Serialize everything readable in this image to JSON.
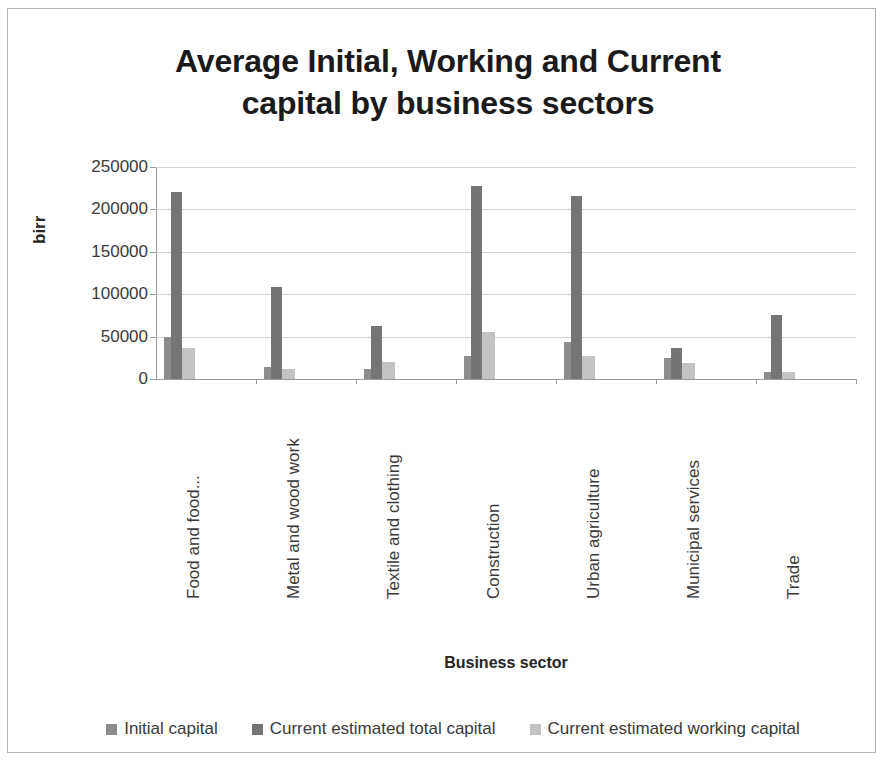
{
  "chart_data": {
    "type": "bar",
    "title": "Average Initial, Working and Current capital by business sectors",
    "title_line1": "Average Initial, Working and Current",
    "title_line2": "capital by business sectors",
    "xlabel": "Business sector",
    "ylabel": "birr",
    "ylim": [
      0,
      250000
    ],
    "ytick_labels": [
      "250000",
      "200000",
      "150000",
      "100000",
      "50000",
      "0"
    ],
    "ytick_values": [
      250000,
      200000,
      150000,
      100000,
      50000,
      0
    ],
    "grid": true,
    "legend_position": "bottom",
    "bar_overlap": true,
    "categories": [
      "Food and food...",
      "Metal and wood work",
      "Textile and clothing",
      "Construction",
      "Urban agriculture",
      "Municipal services",
      "Trade"
    ],
    "series": [
      {
        "name": "Initial capital",
        "color": "#8c8c8c",
        "values": [
          50000,
          14000,
          12000,
          27000,
          44000,
          25000,
          8000
        ]
      },
      {
        "name": "Current estimated total capital",
        "color": "#757575",
        "values": [
          220000,
          109000,
          62000,
          228000,
          216000,
          37000,
          75000
        ]
      },
      {
        "name": "Current estimated working capital",
        "color": "#c3c3c3",
        "values": [
          37000,
          12000,
          20000,
          56000,
          27000,
          19000,
          8000
        ]
      }
    ]
  },
  "colors": {
    "series_initial": "#8c8c8c",
    "series_total": "#757575",
    "series_working": "#c3c3c3",
    "gridline": "#d2d2d2",
    "axis": "#9a9a9a",
    "text": "#3a3a3a",
    "title": "#1a1a1a",
    "frame_border": "#b4b4b4"
  }
}
